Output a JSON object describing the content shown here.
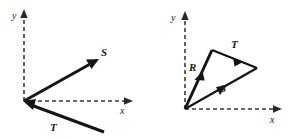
{
  "figure": {
    "title": "",
    "background_color": "#ffffff",
    "ink_color": "#151515",
    "axis_color": "#3a3a3a",
    "width": 292,
    "height": 139,
    "panels": [
      {
        "id": "left",
        "name": "vectors-S-and-T",
        "origin": {
          "x": 24,
          "y": 101
        },
        "axes": {
          "x": {
            "label": "x",
            "label_x": 122,
            "label_y": 113,
            "from": {
              "x": 24,
              "y": 101
            },
            "to": {
              "x": 131,
              "y": 101
            },
            "style": "dashed",
            "arrow": "end"
          },
          "y": {
            "label": "y",
            "label_x": 12,
            "label_y": 19,
            "from": {
              "x": 24,
              "y": 101
            },
            "to": {
              "x": 24,
              "y": 12
            },
            "style": "dashed",
            "arrow": "end"
          }
        },
        "vectors": [
          {
            "label": "S",
            "label_x": 103,
            "label_y": 56,
            "tail": {
              "x": 24,
              "y": 101
            },
            "head": {
              "x": 97,
              "y": 60
            },
            "arrow_at": "head",
            "description": "vector S points up and to the right from the origin"
          },
          {
            "label": "T",
            "label_x": 52,
            "label_y": 130,
            "tail": {
              "x": 103,
              "y": 131
            },
            "head": {
              "x": 25,
              "y": 102
            },
            "arrow_at": "head",
            "description": "vector T points up and to the left, its head at the origin"
          }
        ]
      },
      {
        "id": "right",
        "name": "vector-triangle-R-S-T",
        "origin": {
          "x": 39,
          "y": 109
        },
        "axes": {
          "x": {
            "label": "x",
            "label_x": 126,
            "label_y": 122,
            "from": {
              "x": 39,
              "y": 109
            },
            "to": {
              "x": 134,
              "y": 109
            },
            "style": "dashed",
            "arrow": "end"
          },
          "y": {
            "label": "y",
            "label_x": 25,
            "label_y": 21,
            "from": {
              "x": 39,
              "y": 109
            },
            "to": {
              "x": 39,
              "y": 14
            },
            "style": "dashed",
            "arrow": "end"
          }
        },
        "vectors": [
          {
            "label": "R",
            "label_x": 45,
            "label_y": 70,
            "tail": {
              "x": 39,
              "y": 109
            },
            "head": {
              "x": 66,
              "y": 50
            },
            "arrow_at": "midpoint",
            "description": "resultant-style leg R from the origin up to the triangle apex"
          },
          {
            "label": "T",
            "label_x": 87,
            "label_y": 48,
            "tail": {
              "x": 66,
              "y": 50
            },
            "head": {
              "x": 111,
              "y": 68
            },
            "arrow_at": "midpoint",
            "description": "vector T from the apex down to the right vertex"
          },
          {
            "label": "S",
            "label_x": 76,
            "label_y": 91,
            "tail": {
              "x": 39,
              "y": 109
            },
            "head": {
              "x": 111,
              "y": 68
            },
            "arrow_at": "midpoint",
            "description": "vector S from the origin up to the right vertex, closing the triangle"
          }
        ]
      }
    ]
  }
}
